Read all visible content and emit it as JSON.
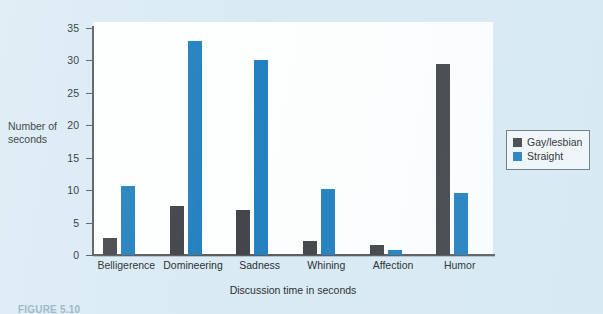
{
  "chart_data": {
    "type": "bar",
    "title": "",
    "xlabel": "Discussion time in seconds",
    "ylabel": "Number of seconds",
    "ylabel_lines": [
      "Number of",
      "seconds"
    ],
    "categories": [
      "Belligerence",
      "Domineering",
      "Sadness",
      "Whining",
      "Affection",
      "Humor"
    ],
    "series": [
      {
        "name": "Gay/lesbian",
        "color": "#3f4245",
        "values": [
          2.6,
          7.5,
          6.9,
          2.1,
          1.6,
          29.4
        ]
      },
      {
        "name": "Straight",
        "color": "#1f7ebd",
        "values": [
          10.7,
          33.0,
          30.0,
          10.2,
          0.7,
          9.6
        ]
      }
    ],
    "ylim": [
      0,
      35
    ],
    "yticks": [
      0,
      5,
      10,
      15,
      20,
      25,
      30,
      35
    ],
    "ytick_labels": [
      "0",
      "5",
      "10",
      "15",
      "20",
      "25",
      "30",
      "35"
    ],
    "grid": false,
    "legend_position": "right"
  },
  "legend": {
    "entries": [
      {
        "label": "Gay/lesbian",
        "color": "#3f4245"
      },
      {
        "label": "Straight",
        "color": "#1f7ebd"
      }
    ]
  },
  "caption": {
    "text": "FIGURE 5.10"
  },
  "page": {
    "background_color": "#d9eaf4",
    "panel_color": "#fdfefe",
    "axis_color": "#55595c"
  }
}
